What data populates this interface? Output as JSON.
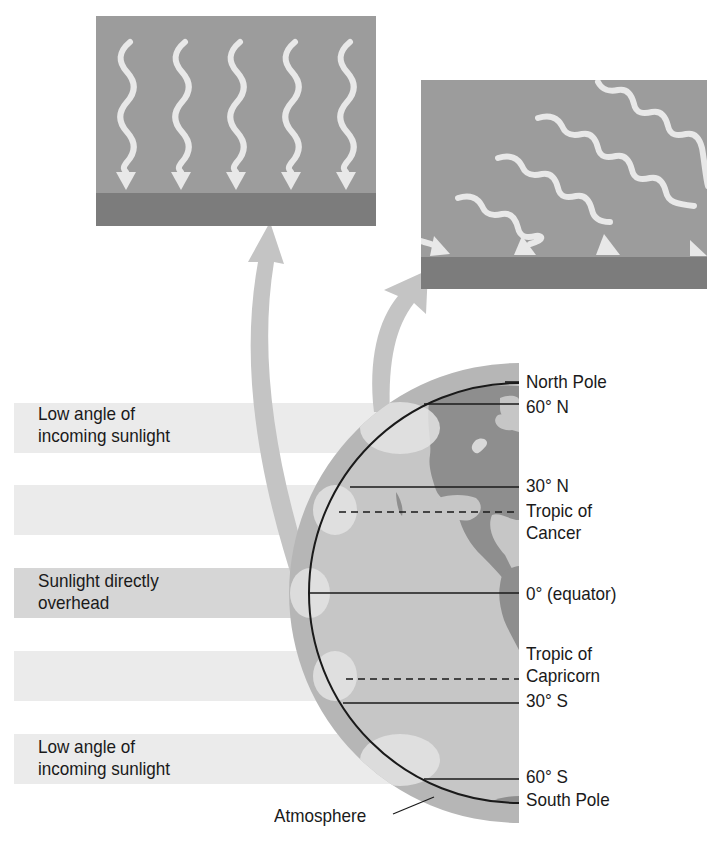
{
  "diagram": {
    "panels": [
      {
        "id": "direct",
        "description": "Sunlight striking ground directly overhead",
        "ray_count": 5,
        "ray_direction": "vertical"
      },
      {
        "id": "oblique",
        "description": "Sunlight striking ground at low angle",
        "ray_count": 5,
        "ray_direction": "diagonal"
      }
    ],
    "band_labels": [
      {
        "text": "Low angle of\nincoming sunlight"
      },
      {
        "text": ""
      },
      {
        "text": "Sunlight directly\noverhead"
      },
      {
        "text": ""
      },
      {
        "text": "Low angle of\nincoming sunlight"
      }
    ],
    "latitude_labels": {
      "north_pole": "North Pole",
      "n60": "60° N",
      "n30": "30° N",
      "tropic_cancer": "Tropic of\nCancer",
      "equator": "0°  (equator)",
      "tropic_capricorn": "Tropic of\nCapricorn",
      "s30": "30° S",
      "s60": "60° S",
      "south_pole": "South Pole"
    },
    "callouts": {
      "atmosphere": "Atmosphere"
    },
    "colors": {
      "panel_sky": "#9a9a9a",
      "panel_ground": "#7a7a7a",
      "ray": "#e6e6e6",
      "band": "#e9e9e9",
      "band_dark": "#d2d2d2",
      "atmosphere": "#b4b4b4",
      "ocean": "#c4c4c4",
      "land": "#8c8c8c",
      "curved_arrow": "#c2c2c2"
    }
  }
}
